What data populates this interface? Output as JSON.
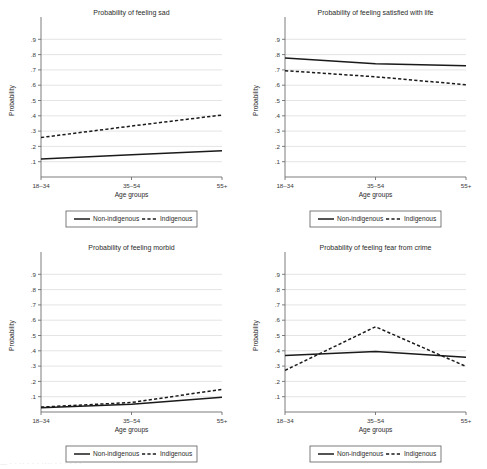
{
  "figure": {
    "axis_label_y": "Probability",
    "axis_label_x": "Age groups",
    "categories": [
      "18–34",
      "35–54",
      "55+"
    ],
    "y_ticks": [
      ".1",
      ".2",
      ".3",
      ".4",
      ".5",
      ".6",
      ".7",
      ".8",
      ".9"
    ],
    "legend": {
      "solid_label": "Non-indigenous",
      "dashed_label": "Indigenous"
    },
    "colors": {
      "line": "#1a1a1a",
      "grid": "#d9d9d9",
      "axis": "#6e6e6e",
      "background": "#ffffff"
    },
    "footer_text": "— · · ·· · · ·  ····  · · · ·  · ·"
  },
  "chart_data": [
    {
      "type": "line",
      "panel": "top-left",
      "title": "Probability of feeling sad",
      "xlabel": "Age groups",
      "ylabel": "Probability",
      "categories": [
        "18–34",
        "35–54",
        "55+"
      ],
      "ylim": [
        0,
        1
      ],
      "yticks": [
        0.1,
        0.2,
        0.3,
        0.4,
        0.5,
        0.6,
        0.7,
        0.8,
        0.9
      ],
      "grid": true,
      "legend_position": "below",
      "series": [
        {
          "name": "Non-indigenous",
          "style": "solid",
          "values": [
            0.118,
            0.145,
            0.172
          ]
        },
        {
          "name": "Indigenous",
          "style": "dashed",
          "values": [
            0.258,
            0.333,
            0.405
          ]
        }
      ]
    },
    {
      "type": "line",
      "panel": "top-right",
      "title": "Probability of feeling satisfied with life",
      "xlabel": "Age groups",
      "ylabel": "Probability",
      "categories": [
        "18–34",
        "35–54",
        "55+"
      ],
      "ylim": [
        0,
        1
      ],
      "yticks": [
        0.1,
        0.2,
        0.3,
        0.4,
        0.5,
        0.6,
        0.7,
        0.8,
        0.9
      ],
      "grid": true,
      "legend_position": "below",
      "series": [
        {
          "name": "Non-indigenous",
          "style": "solid",
          "values": [
            0.777,
            0.74,
            0.727
          ]
        },
        {
          "name": "Indigenous",
          "style": "dashed",
          "values": [
            0.695,
            0.655,
            0.603
          ]
        }
      ]
    },
    {
      "type": "line",
      "panel": "bottom-left",
      "title": "Probability of feeling morbid",
      "xlabel": "Age groups",
      "ylabel": "Probability",
      "categories": [
        "18–34",
        "35–54",
        "55+"
      ],
      "ylim": [
        0,
        1
      ],
      "yticks": [
        0.1,
        0.2,
        0.3,
        0.4,
        0.5,
        0.6,
        0.7,
        0.8,
        0.9
      ],
      "grid": true,
      "legend_position": "below",
      "series": [
        {
          "name": "Non-indigenous",
          "style": "solid",
          "values": [
            0.028,
            0.05,
            0.097
          ]
        },
        {
          "name": "Indigenous",
          "style": "dashed",
          "values": [
            0.032,
            0.062,
            0.148
          ]
        }
      ]
    },
    {
      "type": "line",
      "panel": "bottom-right",
      "title": "Probability of feeling fear from crime",
      "xlabel": "Age groups",
      "ylabel": "Probability",
      "categories": [
        "18–34",
        "35–54",
        "55+"
      ],
      "ylim": [
        0,
        1
      ],
      "yticks": [
        0.1,
        0.2,
        0.3,
        0.4,
        0.5,
        0.6,
        0.7,
        0.8,
        0.9
      ],
      "grid": true,
      "legend_position": "below",
      "series": [
        {
          "name": "Non-indigenous",
          "style": "solid",
          "values": [
            0.37,
            0.395,
            0.358
          ]
        },
        {
          "name": "Indigenous",
          "style": "dashed",
          "values": [
            0.272,
            0.557,
            0.298
          ]
        }
      ]
    }
  ]
}
